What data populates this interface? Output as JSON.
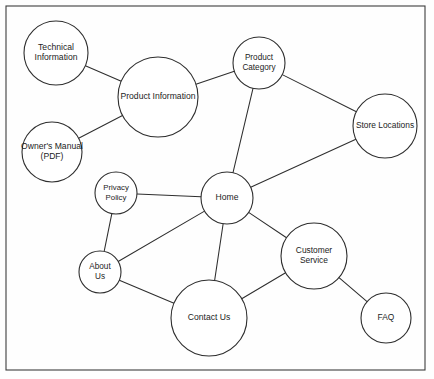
{
  "diagram": {
    "canvas": {
      "width": 434,
      "height": 379
    },
    "frame": {
      "x": 6,
      "y": 6,
      "width": 419,
      "height": 364,
      "stroke": "#3c3c3c"
    },
    "style": {
      "node_fill": "#ffffff",
      "node_stroke": "#2e2e2e",
      "edge_stroke": "#2e2e2e",
      "text_color": "#1c1c1c",
      "background": "#fefefe"
    },
    "nodes": [
      {
        "id": "technical-information",
        "label": "Technical Information",
        "lines": [
          "Technical",
          "Information"
        ],
        "cx": 56,
        "cy": 53,
        "r": 32,
        "font_size": 8.6
      },
      {
        "id": "product-information",
        "label": "Product Information",
        "lines": [
          "Product Information"
        ],
        "cx": 158,
        "cy": 97,
        "r": 40,
        "font_size": 8.6
      },
      {
        "id": "owners-manual",
        "label": "Owner's Manual (PDF)",
        "lines": [
          "Owner's Manual",
          "(PDF)"
        ],
        "cx": 52,
        "cy": 152,
        "r": 30,
        "font_size": 8.6
      },
      {
        "id": "product-category",
        "label": "Product Category",
        "lines": [
          "Product",
          "Category"
        ],
        "cx": 259,
        "cy": 63,
        "r": 26,
        "font_size": 8.2
      },
      {
        "id": "store-locations",
        "label": "Store Locations",
        "lines": [
          "Store Locations"
        ],
        "cx": 385,
        "cy": 126,
        "r": 32,
        "font_size": 8.4
      },
      {
        "id": "privacy-policy",
        "label": "Privacy Policy",
        "lines": [
          "Privacy",
          "Policy"
        ],
        "cx": 116,
        "cy": 193,
        "r": 21,
        "font_size": 7.8
      },
      {
        "id": "home",
        "label": "Home",
        "lines": [
          "Home"
        ],
        "cx": 227,
        "cy": 198,
        "r": 26,
        "font_size": 8.6
      },
      {
        "id": "about-us",
        "label": "About Us",
        "lines": [
          "About",
          "Us"
        ],
        "cx": 100,
        "cy": 272,
        "r": 21,
        "font_size": 8.2
      },
      {
        "id": "customer-service",
        "label": "Customer Service",
        "lines": [
          "Customer",
          "Service"
        ],
        "cx": 314,
        "cy": 256,
        "r": 33,
        "font_size": 8.4
      },
      {
        "id": "contact-us",
        "label": "Contact Us",
        "lines": [
          "Contact Us"
        ],
        "cx": 209,
        "cy": 318,
        "r": 38,
        "font_size": 8.6
      },
      {
        "id": "faq",
        "label": "FAQ",
        "lines": [
          "FAQ"
        ],
        "cx": 386,
        "cy": 318,
        "r": 25,
        "font_size": 8.4
      }
    ],
    "edges": [
      {
        "id": "edge-technical-information-product-information",
        "from": "technical-information",
        "to": "product-information"
      },
      {
        "id": "edge-owners-manual-product-information",
        "from": "owners-manual",
        "to": "product-information"
      },
      {
        "id": "edge-product-information-product-category",
        "from": "product-information",
        "to": "product-category"
      },
      {
        "id": "edge-product-category-store-locations",
        "from": "product-category",
        "to": "store-locations"
      },
      {
        "id": "edge-product-category-home",
        "from": "product-category",
        "to": "home"
      },
      {
        "id": "edge-store-locations-home",
        "from": "store-locations",
        "to": "home"
      },
      {
        "id": "edge-privacy-policy-home",
        "from": "privacy-policy",
        "to": "home"
      },
      {
        "id": "edge-privacy-policy-about-us",
        "from": "privacy-policy",
        "to": "about-us"
      },
      {
        "id": "edge-about-us-home",
        "from": "about-us",
        "to": "home"
      },
      {
        "id": "edge-about-us-contact-us",
        "from": "about-us",
        "to": "contact-us"
      },
      {
        "id": "edge-home-contact-us",
        "from": "home",
        "to": "contact-us"
      },
      {
        "id": "edge-home-customer-service",
        "from": "home",
        "to": "customer-service"
      },
      {
        "id": "edge-customer-service-contact-us",
        "from": "customer-service",
        "to": "contact-us"
      },
      {
        "id": "edge-customer-service-faq",
        "from": "customer-service",
        "to": "faq"
      }
    ]
  }
}
